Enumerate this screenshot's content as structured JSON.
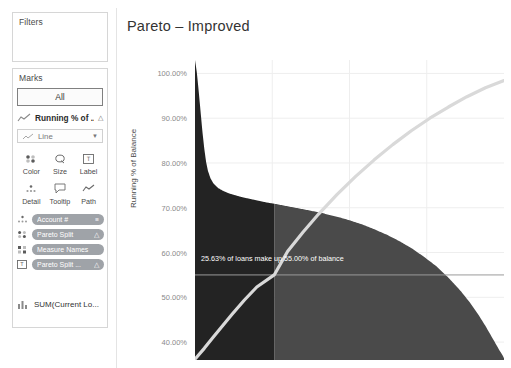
{
  "sidebar": {
    "filters": {
      "title": "Filters"
    },
    "marks": {
      "title": "Marks",
      "all_label": "All",
      "mark_field_label": "Running % of ...",
      "mark_field_icon": "line-chart-icon",
      "mark_field_badge": "delta-icon",
      "type_dropdown": {
        "value": "Line",
        "icon": "line-chart-icon",
        "caret": "chevron-down-icon"
      },
      "properties": [
        {
          "label": "Color",
          "icon": "color-icon"
        },
        {
          "label": "Size",
          "icon": "size-icon"
        },
        {
          "label": "Label",
          "icon": "label-icon"
        },
        {
          "label": "Detail",
          "icon": "detail-icon"
        },
        {
          "label": "Tooltip",
          "icon": "tooltip-icon"
        },
        {
          "label": "Path",
          "icon": "path-icon"
        }
      ],
      "pills": [
        {
          "text": "Account #",
          "lead_icon": "detail-icon",
          "end_icon": "sort-icon"
        },
        {
          "text": "Pareto Split",
          "lead_icon": "color-icon",
          "end_icon": "delta-icon"
        },
        {
          "text": "Measure Names",
          "lead_icon": "color-icon",
          "end_icon": ""
        },
        {
          "text": "Pareto Split ...",
          "lead_icon": "label-icon",
          "end_icon": "delta-icon"
        }
      ],
      "measure": {
        "label": "SUM(Current Lo...",
        "icon": "bar-chart-icon"
      }
    }
  },
  "chart_data": {
    "type": "area",
    "title": "Pareto – Improved",
    "xlabel": "",
    "ylabel": "Running % of Balance",
    "ylim": [
      36,
      103
    ],
    "yticks": [
      100.0,
      90.0,
      80.0,
      70.0,
      60.0,
      50.0,
      40.0
    ],
    "ytick_labels": [
      "100.00%",
      "90.00%",
      "80.00%",
      "70.00%",
      "60.00%",
      "50.00%",
      "40.00%"
    ],
    "grid": true,
    "legend_position": "none",
    "annotation": {
      "text": "25.63% of loans make up 55.00% of balance",
      "reference_y": 55.0,
      "reference_x_pct": 25.63
    },
    "split_at_x_pct": 25.63,
    "colors": {
      "segment_dark": "#232323",
      "segment_light": "#4a4a4a",
      "cumulative_line": "#d9d9d9",
      "reference_line": "#9a9a9a",
      "grid": "#eeeeee",
      "tick_text": "#8a8a8a",
      "pill": "#9fa3a8"
    },
    "series": [
      {
        "name": "Balance share per account (sorted descending)",
        "type": "area",
        "x": [
          0,
          0.6,
          1.2,
          1.8,
          2.4,
          3.0,
          3.6,
          4.2,
          5.0,
          6.0,
          7.5,
          9.0,
          11.0,
          13.0,
          15.0,
          17.0,
          19.0,
          21.0,
          23.0,
          25.63,
          28.0,
          31.0,
          34.0,
          37.0,
          40.0,
          43.0,
          46.0,
          50.0,
          54.0,
          58.0,
          62.0,
          66.0,
          70.0,
          74.0,
          78.0,
          82.0,
          86.0,
          89.0,
          92.0,
          94.0,
          96.0,
          97.5,
          98.5,
          99.3,
          99.8,
          100.0
        ],
        "y": [
          103.0,
          100.2,
          96.0,
          91.5,
          87.0,
          83.2,
          80.2,
          78.2,
          76.6,
          75.4,
          74.4,
          73.8,
          73.2,
          72.8,
          72.4,
          72.1,
          71.8,
          71.5,
          71.2,
          70.9,
          70.6,
          70.2,
          69.8,
          69.4,
          69.0,
          68.5,
          68.0,
          67.2,
          66.3,
          65.2,
          64.0,
          62.6,
          61.0,
          59.1,
          57.0,
          54.4,
          51.4,
          48.8,
          45.8,
          43.6,
          41.2,
          39.4,
          38.2,
          37.3,
          36.7,
          36.4
        ]
      },
      {
        "name": "Running % of Balance (cumulative)",
        "type": "line",
        "x": [
          0,
          3,
          6,
          9,
          12,
          16,
          20,
          25.63,
          30,
          35,
          40,
          46,
          52,
          58,
          64,
          70,
          76,
          82,
          88,
          94,
          100
        ],
        "y": [
          36.2,
          38.6,
          41.2,
          43.7,
          46.2,
          49.4,
          52.3,
          55.0,
          60.3,
          64.6,
          68.6,
          73.0,
          77.0,
          80.7,
          84.1,
          87.2,
          90.0,
          92.5,
          94.8,
          96.8,
          98.4
        ]
      }
    ]
  }
}
